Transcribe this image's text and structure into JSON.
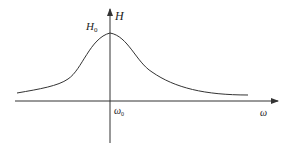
{
  "diagram": {
    "type": "resonance-curve",
    "axes": {
      "y_label": "H",
      "x_label": "ω"
    },
    "annotations": {
      "peak_label": "H",
      "peak_subscript": "0",
      "center_label": "ω",
      "center_subscript": "0"
    },
    "colors": {
      "stroke": "#333333",
      "background": "#ffffff"
    }
  }
}
